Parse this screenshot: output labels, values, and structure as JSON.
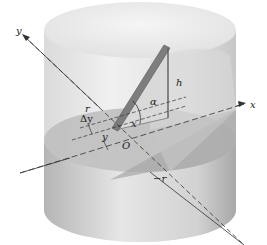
{
  "figure": {
    "axes": {
      "x_label": "x",
      "y_label": "y"
    },
    "labels": {
      "height": "h",
      "angle": "α",
      "delta_y": "Δy",
      "x_dist": "x",
      "y_dist": "y",
      "radius_pos": "r",
      "radius_neg": "−r",
      "origin": "O"
    },
    "colors": {
      "cylinder_light": "#ececec",
      "cylinder_mid": "#cfcfcf",
      "cylinder_dark": "#a9a9a9",
      "base_disk": "#b8b8b8",
      "wedge_face": "#d6d6d6",
      "rod": "#7a7a7a",
      "axis": "#333333"
    }
  }
}
